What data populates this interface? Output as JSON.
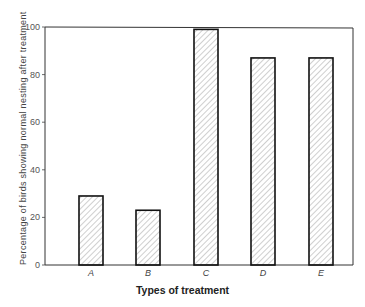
{
  "chart_data": {
    "type": "bar",
    "title": "",
    "xlabel": "Types of treatment",
    "ylabel": "Percentage of birds showing normal nesting after treatment",
    "categories": [
      "A",
      "B",
      "C",
      "D",
      "E"
    ],
    "values": [
      29,
      23,
      99,
      87,
      87
    ],
    "ylim": [
      0,
      100
    ],
    "yticks": [
      0,
      20,
      40,
      60,
      80,
      100
    ],
    "ytick_labels": [
      "0",
      "20",
      "40",
      "60",
      "80",
      "100"
    ],
    "grid": false,
    "legend": null,
    "bar_style": "diagonal hatch, black outline"
  },
  "caption": "Figure 11. The percentage of birds..."
}
